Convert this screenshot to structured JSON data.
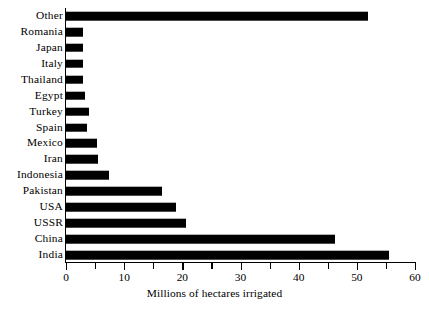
{
  "chart_data": {
    "type": "bar",
    "orientation": "horizontal",
    "title": "",
    "xlabel": "Millions of hectares irrigated",
    "ylabel": "",
    "xlim": [
      0,
      60
    ],
    "grid": false,
    "legend": null,
    "bar_color": "#000000",
    "background_color": "#ffffff",
    "axis_color": "#000000",
    "x_ticks": [
      0,
      5,
      10,
      15,
      20,
      25,
      30,
      35,
      40,
      45,
      50,
      55,
      60
    ],
    "x_tick_labels": [
      "0",
      "",
      "10",
      "",
      "20",
      "",
      "30",
      "",
      "40",
      "",
      "50",
      "",
      "60"
    ],
    "x_major_labels": [
      "0",
      "10",
      "20",
      "30",
      "40",
      "50",
      "60"
    ],
    "categories": [
      "Other",
      "Romania",
      "Japan",
      "Italy",
      "Thailand",
      "Egypt",
      "Turkey",
      "Spain",
      "Mexico",
      "Iran",
      "Indonesia",
      "Pakistan",
      "USA",
      "USSR",
      "China",
      "India"
    ],
    "values": [
      52,
      3,
      3,
      3,
      3,
      3.3,
      4,
      3.6,
      5.3,
      5.5,
      7.4,
      16.5,
      18.9,
      20.6,
      46.2,
      55.5
    ],
    "bars": [
      {
        "label": "Other",
        "value": 52
      },
      {
        "label": "Romania",
        "value": 3
      },
      {
        "label": "Japan",
        "value": 3
      },
      {
        "label": "Italy",
        "value": 3
      },
      {
        "label": "Thailand",
        "value": 3
      },
      {
        "label": "Egypt",
        "value": 3.3
      },
      {
        "label": "Turkey",
        "value": 4
      },
      {
        "label": "Spain",
        "value": 3.6
      },
      {
        "label": "Mexico",
        "value": 5.3
      },
      {
        "label": "Iran",
        "value": 5.5
      },
      {
        "label": "Indonesia",
        "value": 7.4
      },
      {
        "label": "Pakistan",
        "value": 16.5
      },
      {
        "label": "USA",
        "value": 18.9
      },
      {
        "label": "USSR",
        "value": 20.6
      },
      {
        "label": "China",
        "value": 46.2
      },
      {
        "label": "India",
        "value": 55.5
      }
    ]
  }
}
